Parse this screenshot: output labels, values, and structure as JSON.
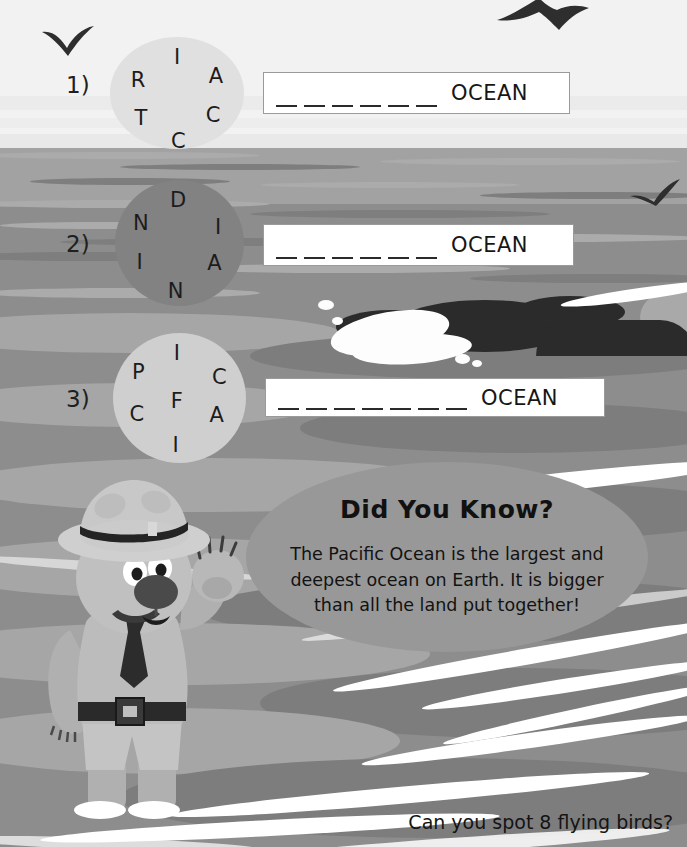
{
  "worksheet": {
    "title_hidden": "",
    "puzzles": [
      {
        "number": "1)",
        "circle_letters": [
          "I",
          "R",
          "A",
          "T",
          "C",
          "C"
        ],
        "answer_word": "ARCTIC",
        "blank_count": 6,
        "suffix": "OCEAN",
        "circle_style": "light"
      },
      {
        "number": "2)",
        "circle_letters": [
          "D",
          "N",
          "I",
          "I",
          "A",
          "N"
        ],
        "answer_word": "INDIAN",
        "blank_count": 6,
        "suffix": "OCEAN",
        "circle_style": "dark"
      },
      {
        "number": "3)",
        "circle_letters": [
          "I",
          "P",
          "C",
          "F",
          "C",
          "A",
          "I"
        ],
        "answer_word": "PACIFIC",
        "blank_count": 7,
        "suffix": "OCEAN",
        "circle_style": "light"
      }
    ]
  },
  "fact_bubble": {
    "heading": "Did You Know?",
    "body": "The Pacific Ocean is the largest and deepest ocean on Earth. It is bigger than all the land put together!"
  },
  "footer": {
    "prompt": "Can you spot 8 flying birds?"
  },
  "colors": {
    "sky": "#f2f2f2",
    "sea": "#8d8d8d",
    "sea_far": "#a2a2a2",
    "circle_light": "#e0e0e0",
    "circle_dark": "#828282",
    "bubble": "#989898",
    "ink": "#1c1c1c",
    "foam": "#ffffff",
    "whale": "#2b2b2b"
  },
  "scene": {
    "bird_count_visible": 3,
    "characters": [
      "ranger-bear"
    ],
    "animals": [
      "whale"
    ]
  }
}
